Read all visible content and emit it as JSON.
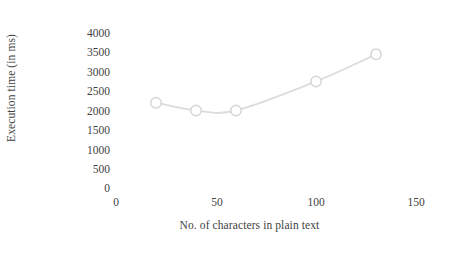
{
  "chart_data": {
    "type": "line",
    "title": "",
    "xlabel": "No. of characters in plain text",
    "ylabel": "Execution time (in ms)",
    "x": [
      20,
      40,
      60,
      100,
      130
    ],
    "values": [
      2200,
      2000,
      2000,
      2750,
      3450
    ],
    "series": [
      {
        "name": "Execution time",
        "x": [
          20,
          40,
          60,
          100,
          130
        ],
        "values": [
          2200,
          2000,
          2000,
          2750,
          3450
        ]
      }
    ],
    "xlim": [
      0,
      150
    ],
    "ylim": [
      0,
      4000
    ],
    "xticks": [
      0,
      50,
      100,
      150
    ],
    "yticks": [
      0,
      500,
      1000,
      1500,
      2000,
      2500,
      3000,
      3500,
      4000
    ],
    "xtick_labels": [
      "0",
      "50",
      "100",
      "150"
    ],
    "ytick_labels": [
      "0",
      "500",
      "1000",
      "1500",
      "2000",
      "2500",
      "3000",
      "3500",
      "4000"
    ],
    "grid": false,
    "legend": false,
    "legend_position": "none",
    "marker": "circle-open",
    "line_color": "#dcdcdc",
    "marker_fill": "#ffffff",
    "marker_stroke": "#d6d6d6",
    "text_color": "#3f3f3f",
    "background_color": "#ffffff"
  }
}
